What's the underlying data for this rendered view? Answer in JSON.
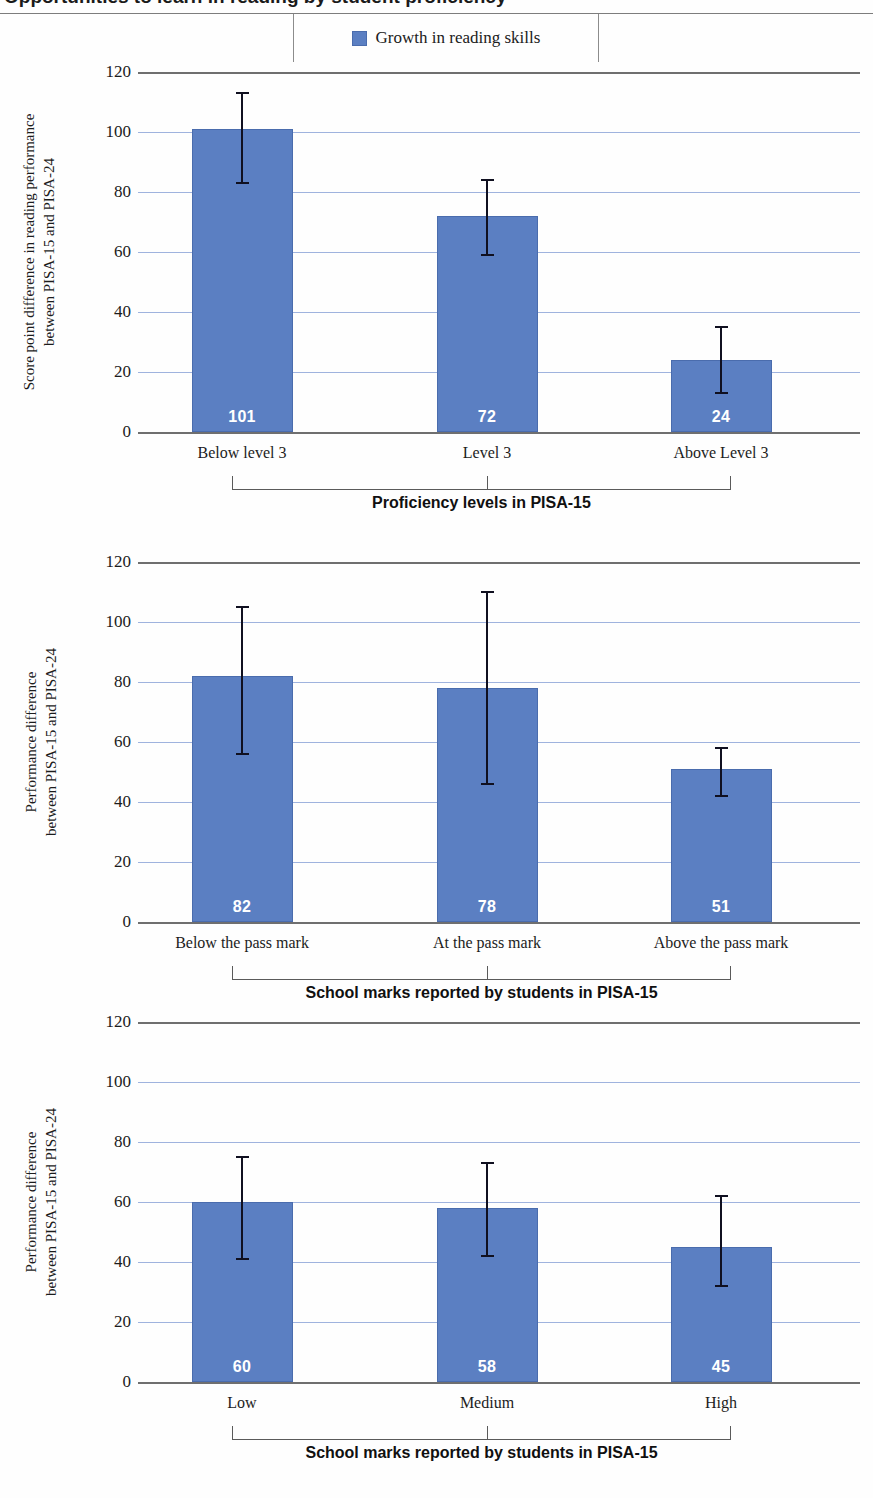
{
  "page": {
    "title_cut_off": "Opportunities to learn in reading by student proficiency",
    "background": "#ffffff"
  },
  "legend": {
    "swatch_color": "#5b7fc2",
    "label": "Growth in reading skills"
  },
  "colors": {
    "bar": "#5b7fc2",
    "bar_border": "#4a6cad",
    "gridline": "#9fb3de",
    "axis": "#6f6f6f",
    "error_bar": "#101020",
    "value_label": "#ffffff"
  },
  "chart_data": [
    {
      "type": "bar",
      "id": "chart-proficiency",
      "title": "",
      "categories": [
        "Below level 3",
        "Level 3",
        "Above Level 3"
      ],
      "values": [
        101,
        72,
        24
      ],
      "value_labels": [
        "101",
        "72",
        "24"
      ],
      "error_high": [
        113,
        84,
        35
      ],
      "error_low": [
        83,
        59,
        13
      ],
      "ylabel_line1": "Score point difference in reading performance",
      "ylabel_line2": "between  PISA-15 and PISA-24",
      "ylabel": "Score point difference in reading performance between PISA-15 and PISA-24",
      "xlabel": "Proficiency levels in PISA-15",
      "ylim": [
        0,
        120
      ],
      "yticks": [
        0,
        20,
        40,
        60,
        80,
        100,
        120
      ],
      "grid": true,
      "legend_position": "top-center"
    },
    {
      "type": "bar",
      "id": "chart-pass-mark",
      "title": "",
      "categories": [
        "Below the pass mark",
        "At the pass mark",
        "Above the pass mark"
      ],
      "values": [
        82,
        78,
        51
      ],
      "value_labels": [
        "82",
        "78",
        "51"
      ],
      "error_high": [
        105,
        110,
        58
      ],
      "error_low": [
        56,
        46,
        42
      ],
      "ylabel_line1": "Performance difference",
      "ylabel_line2": "between PISA-15 and PISA-24",
      "ylabel": "Performance difference between PISA-15 and PISA-24",
      "xlabel": "School marks reported by students in PISA-15",
      "ylim": [
        0,
        120
      ],
      "yticks": [
        0,
        20,
        40,
        60,
        80,
        100,
        120
      ],
      "grid": true,
      "legend_position": "none"
    },
    {
      "type": "bar",
      "id": "chart-school-marks",
      "title": "",
      "categories": [
        "Low",
        "Medium",
        "High"
      ],
      "values": [
        60,
        58,
        45
      ],
      "value_labels": [
        "60",
        "58",
        "45"
      ],
      "error_high": [
        75,
        73,
        62
      ],
      "error_low": [
        41,
        42,
        32
      ],
      "ylabel_line1": "Performance difference",
      "ylabel_line2": "between PISA-15 and PISA-24",
      "ylabel": "Performance difference between PISA-15 and PISA-24",
      "xlabel": "School marks reported by students in PISA-15",
      "ylim": [
        0,
        120
      ],
      "yticks": [
        0,
        20,
        40,
        60,
        80,
        100,
        120
      ],
      "grid": true,
      "legend_position": "none"
    }
  ]
}
